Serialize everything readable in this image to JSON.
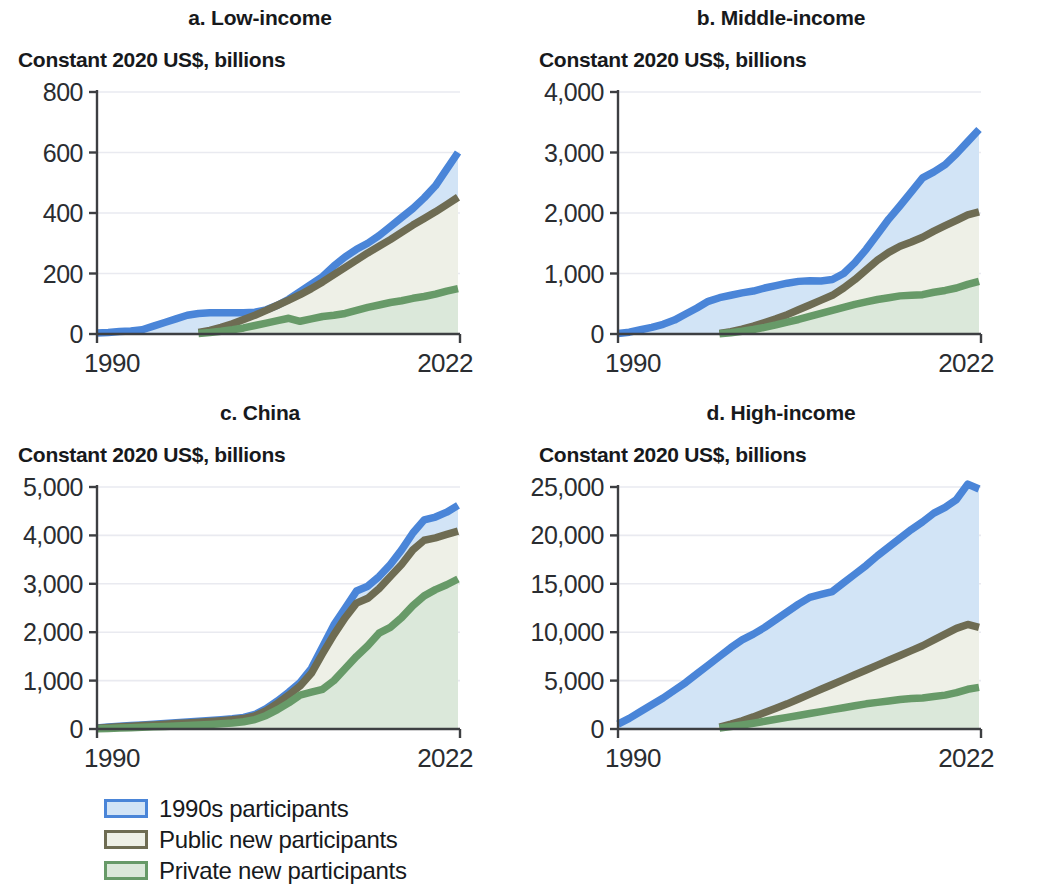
{
  "figure": {
    "axis_label": "Constant 2020 US$, billions",
    "x_start_label": "1990",
    "x_end_label": "2022"
  },
  "legend": {
    "items": [
      {
        "label": "1990s participants",
        "color": "#4a85d8",
        "fill": "#d2e4f6"
      },
      {
        "label": "Public new participants",
        "color": "#6e6c53",
        "fill": "#eef0e7"
      },
      {
        "label": "Private new participants",
        "color": "#679a68",
        "fill": "#dbe8da"
      }
    ]
  },
  "colors": {
    "blue_line": "#4a85d8",
    "blue_fill": "#d2e4f6",
    "public_line": "#6e6c53",
    "public_fill": "#eef0e7",
    "private_line": "#679a68",
    "private_fill": "#dbe8da",
    "axis": "#3d3f42",
    "grid": "#e9eaf0",
    "text": "#17191c"
  },
  "chart_data": [
    {
      "type": "area",
      "panel": "a",
      "title": "a. Low-income",
      "subtitle": "Constant 2020 US$, billions",
      "xlabel": "",
      "ylabel": "Constant 2020 US$, billions",
      "xlim": [
        1990,
        2022
      ],
      "ylim": [
        0,
        800
      ],
      "yticks": [
        0,
        200,
        400,
        600,
        800
      ],
      "ytick_labels": [
        "0",
        "200",
        "400",
        "600",
        "800"
      ],
      "xticks": [
        1990,
        2022
      ],
      "xtick_labels": [
        "1990",
        "2022"
      ],
      "grid": true,
      "legend_position": "below figure",
      "x": [
        1990,
        1991,
        1992,
        1993,
        1994,
        1995,
        1996,
        1997,
        1998,
        1999,
        2000,
        2001,
        2002,
        2003,
        2004,
        2005,
        2006,
        2007,
        2008,
        2009,
        2010,
        2011,
        2012,
        2013,
        2014,
        2015,
        2016,
        2017,
        2018,
        2019,
        2020,
        2021,
        2022
      ],
      "series": [
        {
          "name": "1990s participants",
          "values": [
            3,
            5,
            8,
            10,
            14,
            26,
            38,
            50,
            62,
            68,
            70,
            70,
            70,
            70,
            72,
            80,
            95,
            115,
            140,
            165,
            190,
            225,
            255,
            280,
            300,
            325,
            355,
            385,
            415,
            450,
            490,
            545,
            600,
            650
          ]
        },
        {
          "name": "Public new participants",
          "values": [
            0,
            0,
            0,
            0,
            0,
            0,
            0,
            0,
            0,
            5,
            12,
            22,
            34,
            48,
            62,
            78,
            95,
            112,
            130,
            150,
            172,
            196,
            220,
            244,
            268,
            290,
            312,
            336,
            360,
            382,
            404,
            428,
            452
          ]
        },
        {
          "name": "Private new participants",
          "values": [
            0,
            0,
            0,
            0,
            0,
            0,
            0,
            0,
            0,
            2,
            5,
            9,
            14,
            20,
            28,
            36,
            44,
            52,
            42,
            50,
            58,
            62,
            68,
            78,
            88,
            96,
            104,
            110,
            118,
            124,
            132,
            142,
            150
          ]
        }
      ]
    },
    {
      "type": "area",
      "panel": "b",
      "title": "b. Middle-income",
      "subtitle": "Constant 2020 US$, billions",
      "xlabel": "",
      "ylabel": "Constant 2020 US$, billions",
      "xlim": [
        1990,
        2022
      ],
      "ylim": [
        0,
        4000
      ],
      "yticks": [
        0,
        1000,
        2000,
        3000,
        4000
      ],
      "ytick_labels": [
        "0",
        "1,000",
        "2,000",
        "3,000",
        "4,000"
      ],
      "xticks": [
        1990,
        2022
      ],
      "xtick_labels": [
        "1990",
        "2022"
      ],
      "grid": true,
      "legend_position": "below figure",
      "x": [
        1990,
        1991,
        1992,
        1993,
        1994,
        1995,
        1996,
        1997,
        1998,
        1999,
        2000,
        2001,
        2002,
        2003,
        2004,
        2005,
        2006,
        2007,
        2008,
        2009,
        2010,
        2011,
        2012,
        2013,
        2014,
        2015,
        2016,
        2017,
        2018,
        2019,
        2020,
        2021,
        2022
      ],
      "series": [
        {
          "name": "1990s participants",
          "values": [
            10,
            30,
            70,
            110,
            160,
            230,
            330,
            430,
            540,
            600,
            640,
            680,
            710,
            760,
            800,
            840,
            870,
            880,
            875,
            900,
            1000,
            1180,
            1400,
            1650,
            1900,
            2120,
            2350,
            2580,
            2680,
            2800,
            2980,
            3180,
            3380
          ]
        },
        {
          "name": "Public new participants",
          "values": [
            0,
            0,
            0,
            0,
            0,
            0,
            0,
            0,
            0,
            10,
            40,
            80,
            130,
            190,
            250,
            320,
            400,
            480,
            560,
            640,
            760,
            900,
            1060,
            1220,
            1350,
            1450,
            1520,
            1600,
            1700,
            1790,
            1880,
            1970,
            2020
          ]
        },
        {
          "name": "Private new participants",
          "values": [
            0,
            0,
            0,
            0,
            0,
            0,
            0,
            0,
            0,
            5,
            20,
            45,
            75,
            110,
            150,
            195,
            240,
            290,
            340,
            390,
            440,
            490,
            530,
            570,
            600,
            630,
            640,
            650,
            690,
            720,
            760,
            820,
            870
          ]
        }
      ]
    },
    {
      "type": "area",
      "panel": "c",
      "title": "c. China",
      "subtitle": "Constant 2020 US$, billions",
      "xlabel": "",
      "ylabel": "Constant 2020 US$, billions",
      "xlim": [
        1990,
        2022
      ],
      "ylim": [
        0,
        5000
      ],
      "yticks": [
        0,
        1000,
        2000,
        3000,
        4000,
        5000
      ],
      "ytick_labels": [
        "0",
        "1,000",
        "2,000",
        "3,000",
        "4,000",
        "5,000"
      ],
      "xticks": [
        1990,
        2022
      ],
      "xtick_labels": [
        "1990",
        "2022"
      ],
      "grid": true,
      "legend_position": "below figure",
      "x": [
        1990,
        1991,
        1992,
        1993,
        1994,
        1995,
        1996,
        1997,
        1998,
        1999,
        2000,
        2001,
        2002,
        2003,
        2004,
        2005,
        2006,
        2007,
        2008,
        2009,
        2010,
        2011,
        2012,
        2013,
        2014,
        2015,
        2016,
        2017,
        2018,
        2019,
        2020,
        2021,
        2022
      ],
      "series": [
        {
          "name": "1990s participants",
          "values": [
            20,
            40,
            55,
            70,
            85,
            100,
            115,
            130,
            145,
            160,
            175,
            190,
            210,
            240,
            300,
            420,
            580,
            760,
            960,
            1250,
            1700,
            2150,
            2500,
            2850,
            2950,
            3150,
            3400,
            3700,
            4050,
            4320,
            4380,
            4480,
            4620
          ]
        },
        {
          "name": "Public new participants",
          "values": [
            15,
            30,
            45,
            58,
            72,
            85,
            98,
            112,
            126,
            140,
            155,
            170,
            190,
            215,
            270,
            380,
            530,
            700,
            890,
            1150,
            1560,
            1950,
            2300,
            2600,
            2700,
            2900,
            3150,
            3400,
            3700,
            3900,
            3950,
            4020,
            4090
          ]
        },
        {
          "name": "Private new participants",
          "values": [
            5,
            12,
            20,
            28,
            36,
            45,
            54,
            64,
            74,
            84,
            95,
            108,
            125,
            150,
            195,
            280,
            400,
            540,
            700,
            760,
            820,
            1000,
            1250,
            1500,
            1720,
            1980,
            2100,
            2300,
            2550,
            2750,
            2880,
            2980,
            3100
          ]
        }
      ]
    },
    {
      "type": "area",
      "panel": "d",
      "title": "d. High-income",
      "subtitle": "Constant 2020 US$, billions",
      "xlabel": "",
      "ylabel": "Constant 2020 US$, billions",
      "xlim": [
        1990,
        2022
      ],
      "ylim": [
        0,
        25000
      ],
      "yticks": [
        0,
        5000,
        10000,
        15000,
        20000,
        25000
      ],
      "ytick_labels": [
        "0",
        "5,000",
        "10,000",
        "15,000",
        "20,000",
        "25,000"
      ],
      "xticks": [
        1990,
        2022
      ],
      "xtick_labels": [
        "1990",
        "2022"
      ],
      "grid": true,
      "legend_position": "below figure",
      "x": [
        1990,
        1991,
        1992,
        1993,
        1994,
        1995,
        1996,
        1997,
        1998,
        1999,
        2000,
        2001,
        2002,
        2003,
        2004,
        2005,
        2006,
        2007,
        2008,
        2009,
        2010,
        2011,
        2012,
        2013,
        2014,
        2015,
        2016,
        2017,
        2018,
        2019,
        2020,
        2021,
        2022
      ],
      "series": [
        {
          "name": "1990s participants",
          "values": [
            500,
            1100,
            1800,
            2500,
            3200,
            4000,
            4800,
            5700,
            6600,
            7500,
            8400,
            9200,
            9800,
            10500,
            11300,
            12100,
            12900,
            13600,
            13900,
            14200,
            15100,
            16000,
            16900,
            17900,
            18800,
            19700,
            20600,
            21400,
            22300,
            22900,
            23700,
            25300,
            24800
          ]
        },
        {
          "name": "Public new participants",
          "values": [
            0,
            0,
            0,
            0,
            0,
            0,
            0,
            0,
            0,
            200,
            500,
            850,
            1250,
            1700,
            2150,
            2600,
            3100,
            3600,
            4100,
            4600,
            5100,
            5600,
            6100,
            6600,
            7100,
            7600,
            8100,
            8600,
            9200,
            9800,
            10400,
            10800,
            10500
          ]
        },
        {
          "name": "Private new participants",
          "values": [
            0,
            0,
            0,
            0,
            0,
            0,
            0,
            0,
            0,
            100,
            250,
            420,
            600,
            800,
            1000,
            1200,
            1400,
            1600,
            1800,
            2000,
            2200,
            2400,
            2600,
            2750,
            2900,
            3050,
            3150,
            3200,
            3350,
            3500,
            3750,
            4100,
            4300
          ]
        }
      ]
    }
  ]
}
